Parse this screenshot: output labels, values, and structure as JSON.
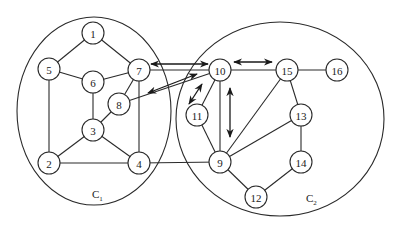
{
  "diagram": {
    "type": "graph-clusters",
    "clusters": [
      {
        "id": "C1",
        "label": "C",
        "subscript": "1",
        "cx": 94,
        "cy": 111,
        "rx": 77,
        "ry": 94,
        "label_x": 92,
        "label_y": 198
      },
      {
        "id": "C2",
        "label": "C",
        "subscript": "2",
        "cx": 280,
        "cy": 119,
        "rx": 104,
        "ry": 97,
        "label_x": 306,
        "label_y": 202
      }
    ],
    "nodes": [
      {
        "id": "1",
        "label": "1",
        "x": 93,
        "y": 33,
        "cluster": "C1"
      },
      {
        "id": "5",
        "label": "5",
        "x": 49,
        "y": 69,
        "cluster": "C1"
      },
      {
        "id": "6",
        "label": "6",
        "x": 93,
        "y": 82,
        "cluster": "C1"
      },
      {
        "id": "7",
        "label": "7",
        "x": 139,
        "y": 70,
        "cluster": "C1"
      },
      {
        "id": "8",
        "label": "8",
        "x": 119,
        "y": 104,
        "cluster": "C1"
      },
      {
        "id": "3",
        "label": "3",
        "x": 93,
        "y": 130,
        "cluster": "C1"
      },
      {
        "id": "2",
        "label": "2",
        "x": 49,
        "y": 163,
        "cluster": "C1"
      },
      {
        "id": "4",
        "label": "4",
        "x": 139,
        "y": 163,
        "cluster": "C1"
      },
      {
        "id": "10",
        "label": "10",
        "x": 220,
        "y": 70,
        "cluster": "C2"
      },
      {
        "id": "15",
        "label": "15",
        "x": 287,
        "y": 70,
        "cluster": "C2"
      },
      {
        "id": "16",
        "label": "16",
        "x": 337,
        "y": 70,
        "cluster": "C2"
      },
      {
        "id": "11",
        "label": "11",
        "x": 197,
        "y": 115,
        "cluster": "C2"
      },
      {
        "id": "13",
        "label": "13",
        "x": 301,
        "y": 115,
        "cluster": "C2"
      },
      {
        "id": "9",
        "label": "9",
        "x": 220,
        "y": 162,
        "cluster": "C2"
      },
      {
        "id": "14",
        "label": "14",
        "x": 301,
        "y": 162,
        "cluster": "C2"
      },
      {
        "id": "12",
        "label": "12",
        "x": 256,
        "y": 197,
        "cluster": "C2"
      }
    ],
    "edges": [
      [
        "1",
        "5"
      ],
      [
        "1",
        "7"
      ],
      [
        "5",
        "6"
      ],
      [
        "5",
        "2"
      ],
      [
        "6",
        "7"
      ],
      [
        "6",
        "3"
      ],
      [
        "7",
        "8"
      ],
      [
        "7",
        "4"
      ],
      [
        "8",
        "3"
      ],
      [
        "3",
        "2"
      ],
      [
        "3",
        "4"
      ],
      [
        "2",
        "4"
      ],
      [
        "4",
        "9"
      ],
      [
        "7",
        "10"
      ],
      [
        "8",
        "10"
      ],
      [
        "10",
        "15"
      ],
      [
        "10",
        "11"
      ],
      [
        "10",
        "9"
      ],
      [
        "11",
        "9"
      ],
      [
        "15",
        "16"
      ],
      [
        "15",
        "13"
      ],
      [
        "15",
        "9"
      ],
      [
        "13",
        "9"
      ],
      [
        "13",
        "14"
      ],
      [
        "14",
        "12"
      ],
      [
        "9",
        "12"
      ]
    ],
    "double_arrows": [
      {
        "between": [
          "7",
          "10"
        ],
        "x1": 151,
        "y1": 64,
        "x2": 208,
        "y2": 64
      },
      {
        "between": [
          "8",
          "10"
        ],
        "x1": 148,
        "y1": 93,
        "x2": 197,
        "y2": 74
      },
      {
        "between": [
          "10",
          "11"
        ],
        "x1": 189,
        "y1": 104,
        "x2": 202,
        "y2": 84
      },
      {
        "between": [
          "10",
          "9"
        ],
        "x1": 230,
        "y1": 88,
        "x2": 230,
        "y2": 137
      },
      {
        "between": [
          "10",
          "15"
        ],
        "x1": 234,
        "y1": 62,
        "x2": 272,
        "y2": 62
      }
    ],
    "node_radius": 11,
    "colors": {
      "stroke": "#2a2a2a",
      "background": "#ffffff",
      "node_fill": "#ffffff"
    }
  }
}
